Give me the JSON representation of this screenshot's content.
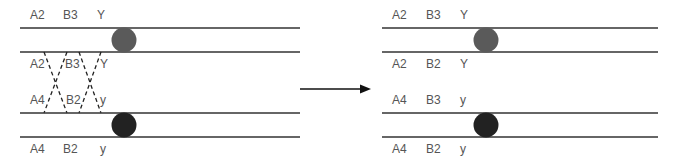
{
  "diagram": {
    "type": "chromosome-crossover",
    "colors": {
      "line": "#333333",
      "label": "#555555",
      "centromere_gray": "#5a5a5a",
      "centromere_dark": "#222222",
      "cross_line": "#222222",
      "arrow": "#111111"
    },
    "left_panel": {
      "top_pair": {
        "upper_labels": [
          "A2",
          "B3",
          "Y"
        ],
        "lower_labels": [
          "A2",
          "B3",
          "Y"
        ]
      },
      "bottom_pair": {
        "upper_labels": [
          "A4",
          "B2",
          "y"
        ],
        "lower_labels": [
          "A4",
          "B2",
          "y"
        ]
      }
    },
    "arrow": {
      "direction": "right"
    },
    "right_panel": {
      "top_pair": {
        "upper_labels": [
          "A2",
          "B3",
          "Y"
        ],
        "lower_labels": [
          "A2",
          "B2",
          "Y"
        ]
      },
      "bottom_pair": {
        "upper_labels": [
          "A4",
          "B3",
          "y"
        ],
        "lower_labels": [
          "A4",
          "B2",
          "y"
        ]
      }
    }
  }
}
